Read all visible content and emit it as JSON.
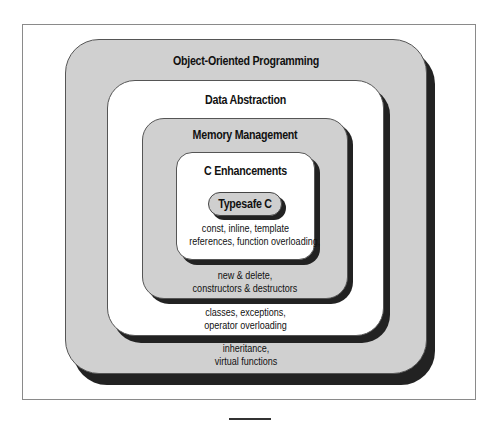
{
  "diagram": {
    "type": "nested-layers",
    "layers": [
      {
        "id": "oop",
        "title": "Object-Oriented Programming",
        "features": [
          "inheritance,",
          "virtual functions"
        ],
        "fill": "#d0d0d0"
      },
      {
        "id": "data-abstraction",
        "title": "Data Abstraction",
        "features": [
          "classes, exceptions,",
          "operator overloading"
        ],
        "fill": "#ffffff"
      },
      {
        "id": "memory-management",
        "title": "Memory Management",
        "features": [
          "new & delete,",
          "constructors & destructors"
        ],
        "fill": "#d0d0d0"
      },
      {
        "id": "c-enhancements",
        "title": "C Enhancements",
        "features": [
          "const, inline, template",
          "references, function overloading,"
        ],
        "fill": "#ffffff"
      },
      {
        "id": "typesafe-c",
        "title": "Typesafe C",
        "fill": "#cfcfcf"
      }
    ],
    "shadow_color": "#222222"
  }
}
